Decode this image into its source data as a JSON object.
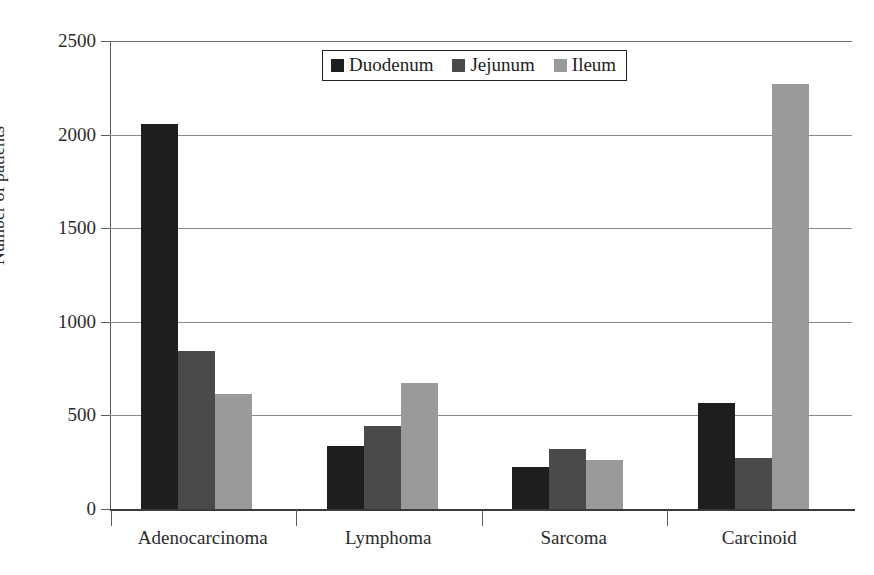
{
  "chart_data": {
    "type": "bar",
    "title": "",
    "subtitle": "",
    "xlabel": "",
    "ylabel": "Number of patients",
    "categories": [
      "Adenocarcinoma",
      "Lymphoma",
      "Sarcoma",
      "Carcinoid"
    ],
    "series": [
      {
        "name": "Duodenum",
        "color": "#1e1e1e",
        "values": [
          2055,
          338,
          224,
          565
        ]
      },
      {
        "name": "Jejunum",
        "color": "#4a4a4a",
        "values": [
          845,
          445,
          318,
          275
        ]
      },
      {
        "name": "Ileum",
        "color": "#9a9a9a",
        "values": [
          612,
          672,
          263,
          2270
        ]
      }
    ],
    "ylim": [
      0,
      2500
    ],
    "ytick_labels": [
      "0",
      "500",
      "1000",
      "1500",
      "2000",
      "2500"
    ],
    "ytick_values": [
      0,
      500,
      1000,
      1500,
      2000,
      2500
    ],
    "grid": true,
    "grid_axis": "y",
    "legend_position": "top-center",
    "legend_entries": [
      "Duodenum",
      "Jejunum",
      "Ileum"
    ],
    "bar_group_order": [
      "Duodenum",
      "Jejunum",
      "Ileum"
    ]
  },
  "axes": {
    "y_axis_title": "Number of patients"
  },
  "colors": {
    "duodenum": "#1e1e1e",
    "jejunum": "#4a4a4a",
    "ileum": "#9a9a9a",
    "gridline": "#8a8a8a",
    "axis": "#5a5a5a",
    "background": "#ffffff"
  }
}
